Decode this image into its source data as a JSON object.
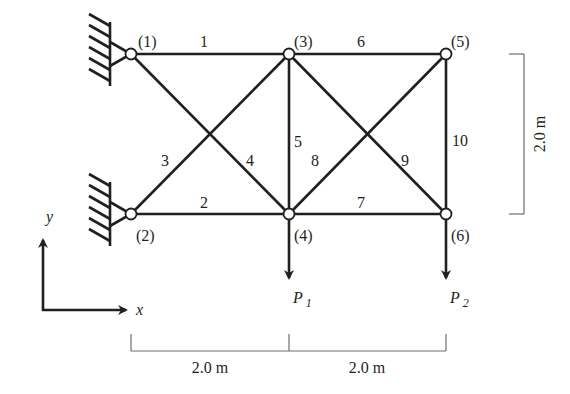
{
  "diagram": {
    "type": "plane truss",
    "nodes": [
      {
        "id": "1",
        "label": "(1)",
        "x": 131,
        "y": 54,
        "support": "pin"
      },
      {
        "id": "2",
        "label": "(2)",
        "x": 131,
        "y": 214,
        "support": "pin"
      },
      {
        "id": "3",
        "label": "(3)",
        "x": 289,
        "y": 54
      },
      {
        "id": "4",
        "label": "(4)",
        "x": 289,
        "y": 214
      },
      {
        "id": "5",
        "label": "(5)",
        "x": 446,
        "y": 54
      },
      {
        "id": "6",
        "label": "(6)",
        "x": 446,
        "y": 214
      }
    ],
    "members": [
      {
        "id": "1",
        "label": "1",
        "from": "1",
        "to": "3"
      },
      {
        "id": "2",
        "label": "2",
        "from": "2",
        "to": "4"
      },
      {
        "id": "3",
        "label": "3",
        "from": "2",
        "to": "3"
      },
      {
        "id": "4",
        "label": "4",
        "from": "1",
        "to": "4"
      },
      {
        "id": "5",
        "label": "5",
        "from": "3",
        "to": "4"
      },
      {
        "id": "6",
        "label": "6",
        "from": "3",
        "to": "5"
      },
      {
        "id": "7",
        "label": "7",
        "from": "4",
        "to": "6"
      },
      {
        "id": "8",
        "label": "8",
        "from": "4",
        "to": "5"
      },
      {
        "id": "9",
        "label": "9",
        "from": "3",
        "to": "6"
      },
      {
        "id": "10",
        "label": "10",
        "from": "5",
        "to": "6"
      }
    ],
    "loads": [
      {
        "node": "4",
        "symbol": "P",
        "subscript": "1",
        "direction": "down"
      },
      {
        "node": "6",
        "symbol": "P",
        "subscript": "2",
        "direction": "down"
      }
    ],
    "dimensions": {
      "horizontal": [
        "2.0 m",
        "2.0 m"
      ],
      "vertical": "2.0 m"
    },
    "axes": {
      "x_label": "x",
      "y_label": "y"
    }
  }
}
